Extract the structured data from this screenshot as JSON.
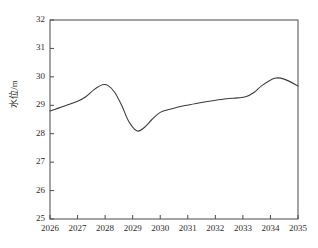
{
  "chart_data": {
    "type": "line",
    "title": "",
    "xlabel": "",
    "ylabel": "水位/m",
    "xlim": [
      2026,
      2035
    ],
    "ylim": [
      25,
      32
    ],
    "grid": false,
    "legend": null,
    "xticks": [
      "2026",
      "2027",
      "2028",
      "2029",
      "2030",
      "2031",
      "2032",
      "2033",
      "2034",
      "2035"
    ],
    "yticks": [
      "25",
      "26",
      "27",
      "28",
      "29",
      "30",
      "31",
      "32"
    ],
    "line_color": "#3b3b3b",
    "series": [
      {
        "name": "水位",
        "x": [
          2026.0,
          2026.3,
          2026.6,
          2027.0,
          2027.3,
          2027.6,
          2027.9,
          2028.1,
          2028.35,
          2028.6,
          2028.85,
          2029.15,
          2029.4,
          2029.7,
          2030.0,
          2030.4,
          2030.9,
          2031.4,
          2031.9,
          2032.4,
          2032.8,
          2033.1,
          2033.4,
          2033.7,
          2034.15,
          2034.5,
          2035.0
        ],
        "y": [
          28.8,
          28.9,
          29.0,
          29.14,
          29.3,
          29.55,
          29.72,
          29.7,
          29.45,
          29.0,
          28.45,
          28.1,
          28.2,
          28.5,
          28.75,
          28.87,
          28.99,
          29.08,
          29.16,
          29.23,
          29.26,
          29.3,
          29.45,
          29.7,
          29.95,
          29.92,
          29.68
        ]
      }
    ]
  },
  "axis": {
    "y_title": "水位/m"
  }
}
